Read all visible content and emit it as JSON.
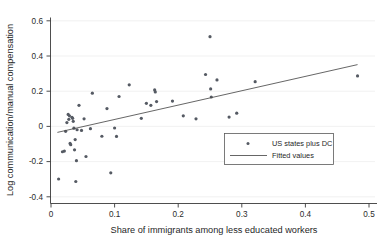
{
  "chart_data": {
    "type": "scatter",
    "title": "",
    "xlabel": "Share of immigrants among less educated workers",
    "ylabel": "Log communication/manual compensation",
    "xlim": [
      -0.012,
      0.52
    ],
    "ylim": [
      -0.45,
      0.66
    ],
    "xticks": [
      0,
      0.1,
      0.2,
      0.3,
      0.4,
      0.5
    ],
    "xticklabels": [
      "0",
      "0.1",
      "0.2",
      "0.3",
      "0.4",
      "0.5"
    ],
    "yticks": [
      -0.4,
      -0.2,
      0,
      0.2,
      0.4,
      0.6
    ],
    "yticklabels": [
      "-0.4",
      "-0.2",
      "0",
      "0.2",
      "0.4",
      "0.6"
    ],
    "grid": "horizontal",
    "legend_position": "lower-right",
    "marker_color": "#555a63",
    "line_color": "#4a4a4a",
    "series": [
      {
        "name": "US states plus DC",
        "kind": "scatter",
        "points": [
          [
            0.012,
            -0.299
          ],
          [
            0.018,
            -0.144
          ],
          [
            0.021,
            -0.14
          ],
          [
            0.023,
            -0.028
          ],
          [
            0.025,
            0.022
          ],
          [
            0.027,
            0.068
          ],
          [
            0.028,
            0.04
          ],
          [
            0.029,
            0.06
          ],
          [
            0.03,
            -0.097
          ],
          [
            0.031,
            -0.104
          ],
          [
            0.033,
            0.052
          ],
          [
            0.034,
            0.046
          ],
          [
            0.035,
            0.029
          ],
          [
            0.036,
            -0.01
          ],
          [
            0.037,
            -0.133
          ],
          [
            0.038,
            -0.075
          ],
          [
            0.039,
            -0.313
          ],
          [
            0.04,
            -0.195
          ],
          [
            0.041,
            -0.019
          ],
          [
            0.044,
            0.12
          ],
          [
            0.048,
            -0.023
          ],
          [
            0.052,
            0.043
          ],
          [
            0.055,
            -0.171
          ],
          [
            0.062,
            -0.013
          ],
          [
            0.065,
            0.189
          ],
          [
            0.08,
            -0.056
          ],
          [
            0.088,
            0.101
          ],
          [
            0.094,
            -0.264
          ],
          [
            0.1,
            -0.009
          ],
          [
            0.103,
            -0.057
          ],
          [
            0.107,
            0.17
          ],
          [
            0.123,
            0.236
          ],
          [
            0.142,
            0.046
          ],
          [
            0.15,
            0.131
          ],
          [
            0.157,
            0.12
          ],
          [
            0.163,
            0.207
          ],
          [
            0.164,
            0.196
          ],
          [
            0.166,
            0.141
          ],
          [
            0.191,
            0.144
          ],
          [
            0.208,
            0.06
          ],
          [
            0.228,
            0.043
          ],
          [
            0.243,
            0.295
          ],
          [
            0.25,
            0.51
          ],
          [
            0.251,
            0.213
          ],
          [
            0.252,
            0.167
          ],
          [
            0.261,
            0.264
          ],
          [
            0.28,
            0.053
          ],
          [
            0.292,
            0.075
          ],
          [
            0.321,
            0.254
          ],
          [
            0.482,
            0.287
          ]
        ]
      },
      {
        "name": "Fitted values",
        "kind": "line",
        "endpoints": [
          [
            0.01,
            -0.034
          ],
          [
            0.482,
            0.351
          ]
        ],
        "slope": 0.816,
        "intercept": -0.042
      }
    ]
  },
  "legend": {
    "entries": [
      {
        "label": "US states plus DC",
        "symbol": "marker"
      },
      {
        "label": "Fitted values",
        "symbol": "line"
      }
    ]
  }
}
